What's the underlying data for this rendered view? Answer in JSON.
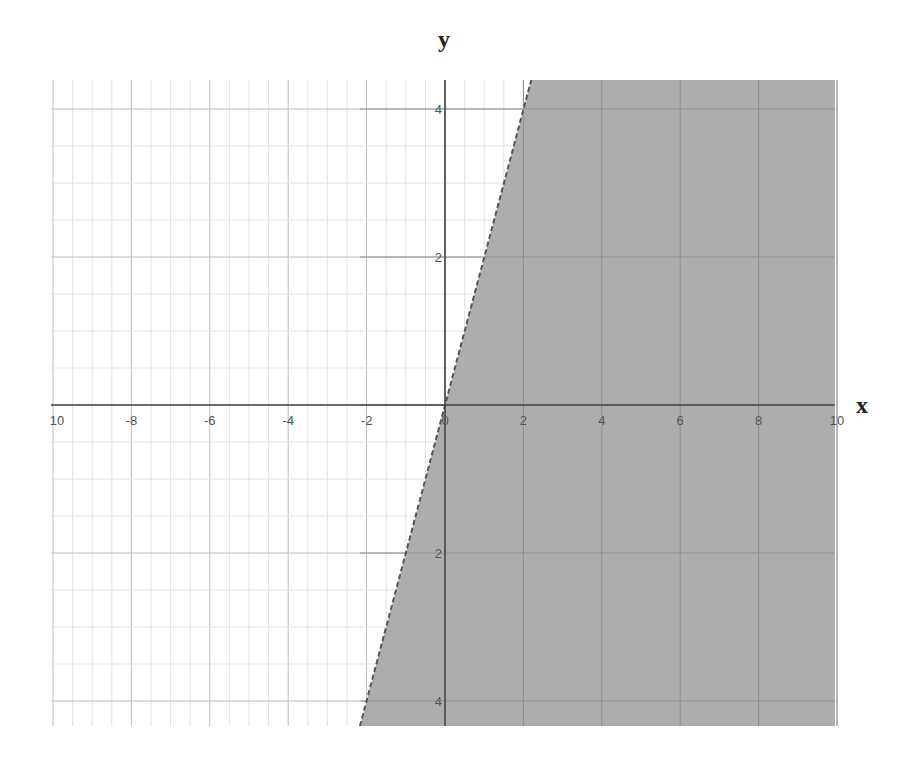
{
  "chart_data": {
    "type": "area",
    "title": "",
    "xlabel": "x",
    "ylabel": "y",
    "xlim": [
      -10,
      10
    ],
    "ylim": [
      -4.35,
      4.4
    ],
    "grid": true,
    "x_ticks": [
      -10,
      -8,
      -6,
      -4,
      -2,
      0,
      2,
      4,
      6,
      8,
      10
    ],
    "x_tick_labels": [
      "10",
      "-8",
      "-6",
      "-4",
      "-2",
      "0",
      "2",
      "4",
      "6",
      "8",
      "10"
    ],
    "y_ticks": [
      4,
      2,
      -2,
      -4
    ],
    "y_tick_labels": [
      "4",
      "2",
      "2",
      "4"
    ],
    "boundary_line": {
      "equation": "y = 2x",
      "style": "dashed",
      "points": [
        [
          -2.17,
          -4.35
        ],
        [
          2.2,
          4.4
        ]
      ]
    },
    "shaded_region": {
      "description": "y < 2x (right of line)",
      "color": "#a9a9a9"
    },
    "legend": null
  },
  "labels": {
    "x_axis": "x",
    "y_axis": "y"
  }
}
